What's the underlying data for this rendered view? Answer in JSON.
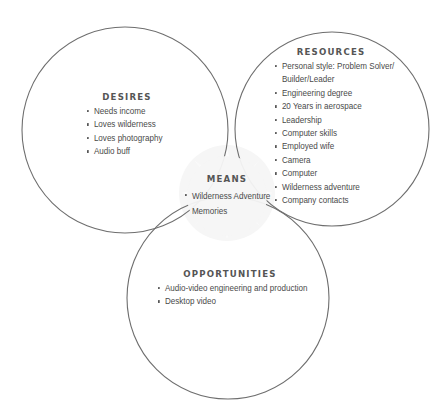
{
  "diagram": {
    "type": "venn",
    "colors": {
      "stroke": "#6e6e6e",
      "text": "#4a4a4a",
      "heading": "#555555",
      "watermark": "#f3f3f3"
    },
    "circles": [
      {
        "id": "desires",
        "cx": 125,
        "cy": 130,
        "r": 103
      },
      {
        "id": "resources",
        "cx": 332,
        "cy": 129,
        "r": 97
      },
      {
        "id": "opportunities",
        "cx": 228,
        "cy": 298,
        "r": 101
      }
    ],
    "watermark_icon": "compass-star"
  },
  "desires": {
    "title": "DESIRES",
    "items": [
      "Needs income",
      "Loves wilderness",
      "Loves photography",
      "Audio buff"
    ]
  },
  "resources": {
    "title": "RESOURCES",
    "items": [
      "Personal style: Problem Solver/",
      "Builder/Leader",
      "Engineering degree",
      "20 Years in aerospace",
      "Leadership",
      "Computer skills",
      "Employed wife",
      "Camera",
      "Computer",
      "Wilderness adventure",
      "Company contacts"
    ]
  },
  "means": {
    "title": "MEANS",
    "items": [
      "Wilderness Adventure",
      "Memories"
    ]
  },
  "opportunities": {
    "title": "OPPORTUNITIES",
    "items": [
      "Audio-video engineering and production",
      "Desktop video"
    ]
  }
}
